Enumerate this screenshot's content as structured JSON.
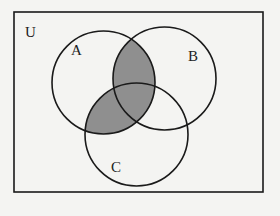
{
  "diagram": {
    "type": "venn",
    "universe_label": "U",
    "sets": [
      {
        "id": "A",
        "label": "A",
        "cx": 103.5,
        "cy": 82.5,
        "r": 51.5,
        "label_x": 76,
        "label_y": 58
      },
      {
        "id": "B",
        "label": "B",
        "cx": 164.5,
        "cy": 78.5,
        "r": 51.5,
        "label_x": 189,
        "label_y": 60
      },
      {
        "id": "C",
        "label": "C",
        "cx": 136.5,
        "cy": 134.5,
        "r": 51.5,
        "label_x": 117,
        "label_y": 166
      }
    ],
    "shaded_region": "A ∩ (B ∪ C)",
    "shaded_description": "(A∩B) ∪ (A∩C)",
    "colors": {
      "shade": "#8f8f8f",
      "stroke": "#1a1a1a",
      "background": "#f4f4f2"
    },
    "frame": {
      "x": 14,
      "y": 12,
      "width": 249,
      "height": 180
    }
  }
}
